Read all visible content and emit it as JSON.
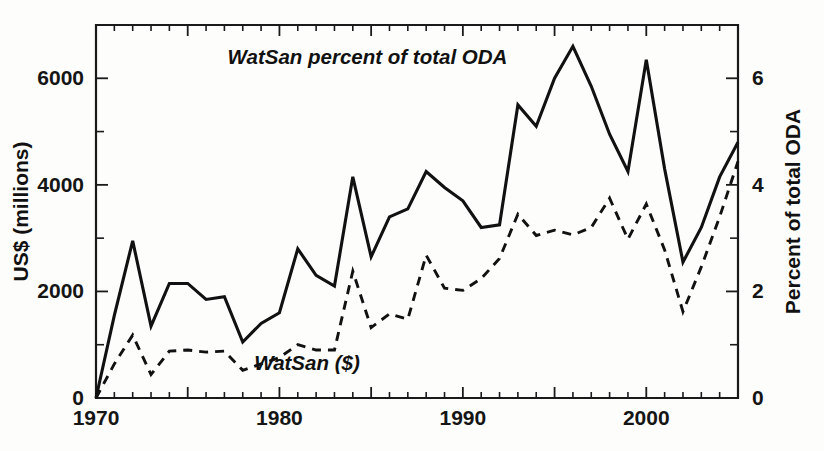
{
  "chart_data": {
    "type": "line",
    "title": "",
    "xlabel": "",
    "ylabel": "US$ (millions)",
    "y2label": "Percent of total ODA",
    "xlim": [
      1970,
      2005
    ],
    "ylim": [
      0,
      7000
    ],
    "y2lim": [
      0,
      7
    ],
    "grid": false,
    "legend_position": "inline-annotations",
    "x": [
      1970,
      1971,
      1972,
      1973,
      1974,
      1975,
      1976,
      1977,
      1978,
      1979,
      1980,
      1981,
      1982,
      1983,
      1984,
      1985,
      1986,
      1987,
      1988,
      1989,
      1990,
      1991,
      1992,
      1993,
      1994,
      1995,
      1996,
      1997,
      1998,
      1999,
      2000,
      2001,
      2002,
      2003,
      2004,
      2005
    ],
    "xticks_major": [
      1970,
      1975,
      1980,
      1985,
      1990,
      1995,
      2000,
      2005
    ],
    "xticklabels": [
      "1970",
      "",
      "1980",
      "",
      "1990",
      "",
      "2000",
      ""
    ],
    "xticklabels_shown": [
      "1970",
      "1980",
      "1990",
      "2000"
    ],
    "yticks_major": [
      0,
      2000,
      4000,
      6000
    ],
    "yticklabels": [
      "0",
      "2000",
      "4000",
      "6000"
    ],
    "yticks_minor": [
      1000,
      3000,
      5000
    ],
    "y2ticks_major": [
      0,
      2,
      4,
      6
    ],
    "y2ticklabels": [
      "0",
      "2",
      "4",
      "6"
    ],
    "y2ticks_minor": [
      1,
      3,
      5
    ],
    "series": [
      {
        "name": "WatSan percent of total ODA",
        "label": "WatSan percent of total ODA",
        "style": "solid",
        "axis": "right",
        "units": "percent of total ODA",
        "values": [
          0.0,
          1.55,
          2.95,
          1.35,
          2.15,
          2.15,
          1.85,
          1.9,
          1.05,
          1.4,
          1.6,
          2.8,
          2.3,
          2.1,
          4.15,
          2.65,
          3.4,
          3.55,
          4.25,
          3.95,
          3.7,
          3.2,
          3.25,
          5.5,
          5.1,
          6.0,
          6.6,
          5.85,
          4.95,
          4.25,
          6.35,
          4.3,
          2.55,
          3.2,
          4.15,
          4.8
        ]
      },
      {
        "name": "WatSan ($)",
        "label": "WatSan ($)",
        "style": "dashed",
        "axis": "left",
        "units": "US$ (millions)",
        "values": [
          0,
          640,
          1180,
          440,
          880,
          900,
          860,
          880,
          520,
          640,
          760,
          1000,
          900,
          900,
          2380,
          1320,
          1580,
          1480,
          2680,
          2060,
          2020,
          2240,
          2620,
          3450,
          3050,
          3150,
          3060,
          3200,
          3750,
          2980,
          3640,
          2780,
          1620,
          2460,
          3400,
          4440
        ]
      }
    ],
    "annotations": [
      {
        "text": "WatSan percent of total ODA",
        "x": 1984.8,
        "y_px": 64
      },
      {
        "text": "WatSan ($)",
        "x": 1981.5,
        "y_px": 370
      }
    ]
  },
  "axes": {
    "left_title": "US$ (millions)",
    "right_title": "Percent of total ODA"
  },
  "colors": {
    "ink": "#111111",
    "background": "#fdfdfb"
  }
}
